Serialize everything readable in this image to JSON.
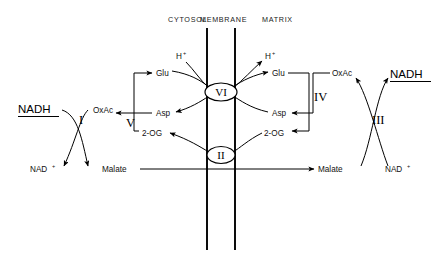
{
  "diagram": {
    "background_color": "#ffffff",
    "line_color": "#000000",
    "compartments": [
      {
        "id": "cytosol",
        "label": "CYTOSOL",
        "x": 168,
        "y": 22
      },
      {
        "id": "membrane",
        "label": "MEMBRANE",
        "x": 222,
        "y": 22
      },
      {
        "id": "matrix",
        "label": "MATRIX",
        "x": 288,
        "y": 22
      }
    ],
    "membrane_lines": [
      {
        "id": "outer-leaflet",
        "x": 207,
        "y1": 28,
        "y2": 250
      },
      {
        "id": "inner-leaflet",
        "x": 235,
        "y1": 28,
        "y2": 250
      }
    ],
    "enzymes": [
      {
        "id": "I",
        "numeral": "I",
        "x": 85,
        "y": 117,
        "side": "cytosol",
        "name": "cytosolic-malate-dehydrogenase"
      },
      {
        "id": "III",
        "numeral": "III",
        "x": 379,
        "y": 117,
        "side": "matrix",
        "name": "mitochondrial-malate-dehydrogenase"
      },
      {
        "id": "V",
        "numeral": "V",
        "x": 131,
        "y": 123,
        "side": "cytosol",
        "name": "cytosolic-aspartate-aminotransferase"
      },
      {
        "id": "IV",
        "numeral": "IV",
        "x": 320,
        "y": 97,
        "side": "matrix",
        "name": "mitochondrial-aspartate-aminotransferase"
      }
    ],
    "transporters": [
      {
        "id": "VI",
        "numeral": "VI",
        "cx": 221,
        "cy": 92,
        "rx": 16,
        "ry": 9,
        "name": "glutamate-aspartate-carrier"
      },
      {
        "id": "II",
        "numeral": "II",
        "cx": 221,
        "cy": 155,
        "rx": 14,
        "ry": 8.5,
        "name": "malate-alpha-ketoglutarate-carrier"
      }
    ],
    "metabolites": [
      {
        "id": "nadh-cytosol",
        "label": "NADH",
        "x": 18,
        "y": 113,
        "underlined": true,
        "style": "major"
      },
      {
        "id": "nad-cytosol",
        "label": "NAD",
        "sup": "+",
        "x": 30,
        "y": 172,
        "style": "minor"
      },
      {
        "id": "oxac-cytosol",
        "label": "OxAc",
        "x": 93,
        "y": 113,
        "style": "minor"
      },
      {
        "id": "malate-cytosol",
        "label": "Malate",
        "x": 102,
        "y": 172,
        "style": "minor"
      },
      {
        "id": "glu-cytosol",
        "label": "Glu",
        "x": 156,
        "y": 74,
        "style": "minor"
      },
      {
        "id": "asp-cytosol",
        "label": "Asp",
        "x": 156,
        "y": 115,
        "style": "minor"
      },
      {
        "id": "og-cytosol",
        "label": "2-OG",
        "x": 145,
        "y": 134,
        "style": "minor"
      },
      {
        "id": "h-cytosol",
        "label": "H",
        "sup": "+",
        "x": 176,
        "y": 57,
        "style": "minor"
      },
      {
        "id": "h-matrix",
        "label": "H",
        "sup": "+",
        "x": 265,
        "y": 57,
        "style": "minor"
      },
      {
        "id": "glu-matrix",
        "label": "Glu",
        "x": 272,
        "y": 74,
        "style": "minor"
      },
      {
        "id": "asp-matrix",
        "label": "Asp",
        "x": 272,
        "y": 115,
        "style": "minor"
      },
      {
        "id": "og-matrix",
        "label": "2-OG",
        "x": 265,
        "y": 134,
        "style": "minor"
      },
      {
        "id": "oxac-matrix",
        "label": "OxAc",
        "x": 334,
        "y": 74,
        "style": "minor"
      },
      {
        "id": "malate-matrix",
        "label": "Malate",
        "x": 320,
        "y": 172,
        "style": "minor"
      },
      {
        "id": "nadh-matrix",
        "label": "NADH",
        "x": 390,
        "y": 78,
        "underlined": true,
        "style": "major"
      },
      {
        "id": "nad-matrix",
        "label": "NAD",
        "sup": "+",
        "x": 385,
        "y": 172,
        "style": "minor"
      }
    ]
  }
}
